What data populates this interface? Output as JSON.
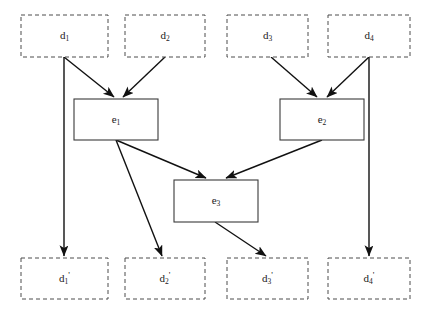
{
  "diagram": {
    "background_color": "#ffffff",
    "box_dashed_stroke": "#4d4d4d",
    "box_solid_stroke": "#3a3a3a",
    "edge_color": "#111111",
    "input_nodes": [
      {
        "id": "d1",
        "base": "d",
        "sub": "1",
        "prime": "",
        "label": "d1",
        "x": 21,
        "y": 15,
        "w": 87,
        "h": 42
      },
      {
        "id": "d2",
        "base": "d",
        "sub": "2",
        "prime": "",
        "label": "d2",
        "x": 125,
        "y": 15,
        "w": 80,
        "h": 42
      },
      {
        "id": "d3",
        "base": "d",
        "sub": "3",
        "prime": "",
        "label": "d3",
        "x": 227,
        "y": 15,
        "w": 81,
        "h": 42
      },
      {
        "id": "d4",
        "base": "d",
        "sub": "4",
        "prime": "",
        "label": "d4",
        "x": 328,
        "y": 15,
        "w": 82,
        "h": 42
      }
    ],
    "process_nodes": [
      {
        "id": "e1",
        "base": "e",
        "sub": "1",
        "prime": "",
        "label": "e1",
        "x": 74,
        "y": 99,
        "w": 84,
        "h": 41
      },
      {
        "id": "e2",
        "base": "e",
        "sub": "2",
        "prime": "",
        "label": "e2",
        "x": 280,
        "y": 99,
        "w": 84,
        "h": 41
      },
      {
        "id": "e3",
        "base": "e",
        "sub": "3",
        "prime": "",
        "label": "e3",
        "x": 174,
        "y": 180,
        "w": 84,
        "h": 42
      }
    ],
    "output_nodes": [
      {
        "id": "d1p",
        "base": "d",
        "sub": "1",
        "prime": "'",
        "label": "d1'",
        "x": 21,
        "y": 258,
        "w": 87,
        "h": 41
      },
      {
        "id": "d2p",
        "base": "d",
        "sub": "2",
        "prime": "'",
        "label": "d2'",
        "x": 125,
        "y": 258,
        "w": 80,
        "h": 41
      },
      {
        "id": "d3p",
        "base": "d",
        "sub": "3",
        "prime": "'",
        "label": "d3'",
        "x": 227,
        "y": 258,
        "w": 81,
        "h": 41
      },
      {
        "id": "d4p",
        "base": "d",
        "sub": "4",
        "prime": "'",
        "label": "d4'",
        "x": 328,
        "y": 258,
        "w": 82,
        "h": 41
      }
    ],
    "edges": [
      {
        "id": "edge-d1-e1",
        "from": "d1",
        "to": "e1",
        "x1": 64,
        "y1": 57,
        "x2": 114,
        "y2": 97
      },
      {
        "id": "edge-d2-e1",
        "from": "d2",
        "to": "e1",
        "x1": 165,
        "y1": 57,
        "x2": 123,
        "y2": 97
      },
      {
        "id": "edge-d3-e2",
        "from": "d3",
        "to": "e2",
        "x1": 271,
        "y1": 57,
        "x2": 317,
        "y2": 97
      },
      {
        "id": "edge-d4-e2",
        "from": "d4",
        "to": "e2",
        "x1": 369,
        "y1": 57,
        "x2": 327,
        "y2": 97
      },
      {
        "id": "edge-d1-d1p",
        "from": "d1",
        "to": "d1p",
        "x1": 64,
        "y1": 57,
        "x2": 64,
        "y2": 256
      },
      {
        "id": "edge-d4-d4p",
        "from": "d4",
        "to": "d4p",
        "x1": 369,
        "y1": 57,
        "x2": 369,
        "y2": 256
      },
      {
        "id": "edge-e1-e3",
        "from": "e1",
        "to": "e3",
        "x1": 116,
        "y1": 140,
        "x2": 206,
        "y2": 178
      },
      {
        "id": "edge-e2-e3",
        "from": "e2",
        "to": "e3",
        "x1": 322,
        "y1": 140,
        "x2": 226,
        "y2": 178
      },
      {
        "id": "edge-e1-d2p",
        "from": "e1",
        "to": "d2p",
        "x1": 116,
        "y1": 140,
        "x2": 162,
        "y2": 256
      },
      {
        "id": "edge-e3-d3p",
        "from": "e3",
        "to": "d3p",
        "x1": 215,
        "y1": 222,
        "x2": 266,
        "y2": 256
      }
    ]
  }
}
